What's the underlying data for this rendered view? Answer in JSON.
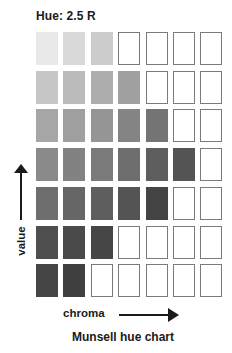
{
  "title": "Hue: 2.5 R",
  "axes": {
    "vertical_label": "value",
    "horizontal_label": "chroma"
  },
  "caption": "Munsell hue chart",
  "grid": {
    "columns": 7,
    "rows": [
      {
        "filled": [
          "#e8e8e8",
          "#d9d9d9",
          "#cccccc"
        ]
      },
      {
        "filled": [
          "#c6c6c6",
          "#bbbbbb",
          "#adadad",
          "#a0a0a0"
        ]
      },
      {
        "filled": [
          "#a6a6a6",
          "#9f9f9f",
          "#959595",
          "#848484",
          "#747474"
        ]
      },
      {
        "filled": [
          "#8a8a8a",
          "#828282",
          "#7a7a7a",
          "#6e6e6e",
          "#5e5e5e",
          "#545454"
        ]
      },
      {
        "filled": [
          "#6e6e6e",
          "#666666",
          "#5e5e5e",
          "#545454",
          "#444444"
        ]
      },
      {
        "filled": [
          "#4e4e4e",
          "#4a4a4a",
          "#464646"
        ]
      },
      {
        "filled": [
          "#454545",
          "#404040"
        ]
      }
    ]
  },
  "colors": {
    "empty_border": "#7a7a7a",
    "text": "#1a1a1a"
  }
}
